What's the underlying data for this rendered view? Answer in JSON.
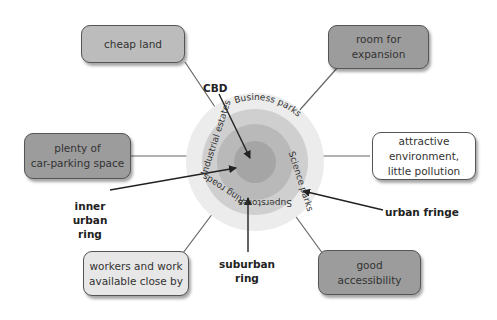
{
  "diagram": {
    "type": "urban location factors diagram",
    "zones": [
      {
        "id": "cbd",
        "label": "CBD"
      },
      {
        "id": "inner",
        "label": "inner urban ring"
      },
      {
        "id": "suburban",
        "label": "suburban ring"
      },
      {
        "id": "fringe",
        "label": "urban fringe"
      }
    ],
    "ring_labels": [
      "Business parks",
      "Science parks",
      "Superstores",
      "Ring roads",
      "Industrial estates"
    ],
    "boxes": [
      {
        "id": "cheap-land",
        "text": "cheap land"
      },
      {
        "id": "room-expansion",
        "text_lines": [
          "room for",
          "expansion"
        ]
      },
      {
        "id": "parking",
        "text_lines": [
          "plenty of",
          "car-parking space"
        ]
      },
      {
        "id": "environment",
        "text_lines": [
          "attractive",
          "environment,",
          "little pollution"
        ]
      },
      {
        "id": "workers",
        "text_lines": [
          "workers and work",
          "available close by"
        ]
      },
      {
        "id": "accessibility",
        "text_lines": [
          "good",
          "accessibility"
        ]
      }
    ],
    "zone_label_lines": {
      "cbd": [
        "CBD"
      ],
      "inner": [
        "inner",
        "urban ring"
      ],
      "suburban": [
        "suburban",
        "ring"
      ],
      "fringe": [
        "urban fringe"
      ]
    },
    "colors": {
      "ring_outer": "#ececec",
      "ring2": "#cfcfcf",
      "ring3": "#b9b9b9",
      "core": "#a3a3a3"
    }
  }
}
